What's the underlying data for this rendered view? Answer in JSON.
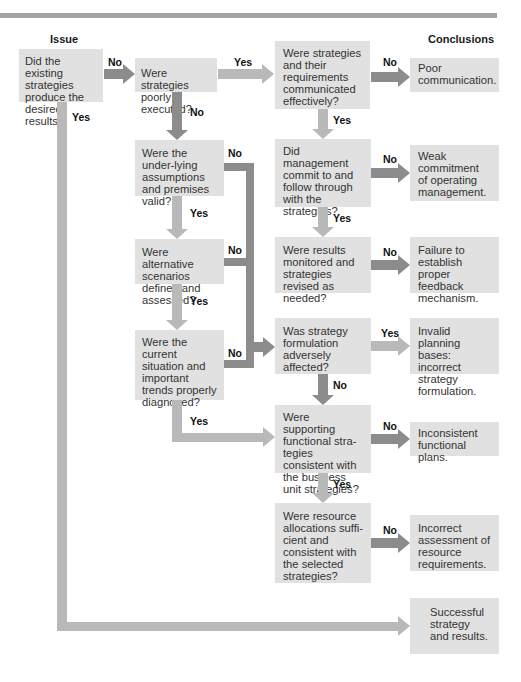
{
  "headers": {
    "issue": "Issue",
    "conclusions": "Conclusions"
  },
  "colors": {
    "box_fill": "#e1e1e1",
    "no_arrow": "#8c8c8c",
    "yes_arrow": "#b9b9b9",
    "top_rule": "#a3a3a3"
  },
  "questions": {
    "q1": "Did the existing strategies produce the desired results?",
    "q2": "Were strategies poorly executed?",
    "q3": "Were strategies and their requirements communicated effectively?",
    "q4": "Did management commit to and follow through with the strategies?",
    "q5": "Were results monitored and strategies revised as needed?",
    "q6": "Were the under-lying assumptions and premises valid?",
    "q7": "Were alternative scenarios defined and assessed?",
    "q8": "Were the current situation and important trends properly diagnosed?",
    "q9": "Was strategy formulation adversely affected?",
    "q10": "Were supporting functional stra-tegies consistent with the business unit strategies?",
    "q11": "Were resource allocations suffi-cient and consistent with the selected strategies?"
  },
  "conclusions": {
    "c1": "Poor communication.",
    "c2": "Weak commitment of operating management.",
    "c3": "Failure to establish proper feedback mechanism.",
    "c4": "Invalid planning bases: incorrect strategy formulation.",
    "c5": "Inconsistent functional plans.",
    "c6": "Incorrect assessment of resource requirements.",
    "c7": "Successful strategy and results."
  },
  "labels": {
    "yes": "Yes",
    "no": "No"
  }
}
